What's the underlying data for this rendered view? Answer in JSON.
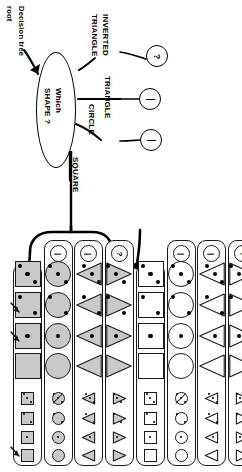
{
  "figure": {
    "type": "decision-tree-diagram",
    "orientation": "rotated-90-clockwise",
    "root_annotation": {
      "line1": "Decision tree",
      "line2": "root"
    },
    "root_node": {
      "line1": "Which",
      "line2": "SHAPE ?"
    },
    "branches": [
      {
        "id": "square",
        "label": "SQUARE"
      },
      {
        "id": "circle",
        "label": "CIRCLE"
      },
      {
        "id": "triangle",
        "label": "TRIANGLE"
      },
      {
        "id": "inverted-triangle",
        "line1": "INVERTED",
        "line2": "TRIANGLE"
      }
    ],
    "leaf_nodes": [
      {
        "id": "leaf-circle",
        "glyph": "|"
      },
      {
        "id": "leaf-triangle",
        "glyph": "|"
      },
      {
        "id": "leaf-inverted-triangle",
        "glyph": "?"
      }
    ],
    "colors": {
      "stroke": "#1a1a1a",
      "fill_gray": "#c9c9c9",
      "fill_white": "#ffffff",
      "background": "#ffffff"
    }
  },
  "grid": {
    "column_header_glyphs": [
      "",
      "|",
      "|",
      "?",
      "",
      "|",
      "|",
      "?"
    ],
    "columns": [
      {
        "id": "col-1",
        "shape": "square",
        "fill": "gray",
        "header": "",
        "linked": true,
        "cells": [
          {
            "size": "large",
            "dots": 3
          },
          {
            "size": "large",
            "dots": 2
          },
          {
            "size": "large",
            "dots": 1
          },
          {
            "size": "large",
            "dots": 0
          },
          {
            "size": "small",
            "dots": 3
          },
          {
            "size": "small",
            "dots": 2
          },
          {
            "size": "small",
            "dots": 1
          },
          {
            "size": "small",
            "dots": 0
          }
        ]
      },
      {
        "id": "col-2",
        "shape": "circle",
        "fill": "gray",
        "header": "|",
        "linked": false,
        "cells": [
          {
            "size": "large",
            "dots": 3
          },
          {
            "size": "large",
            "dots": 2
          },
          {
            "size": "large",
            "dots": 1
          },
          {
            "size": "large",
            "dots": 0
          },
          {
            "size": "small",
            "dots": 3,
            "slash": true
          },
          {
            "size": "small",
            "dots": 2
          },
          {
            "size": "small",
            "dots": 1
          },
          {
            "size": "small",
            "dots": 0
          }
        ]
      },
      {
        "id": "col-3",
        "shape": "triangle-left",
        "fill": "gray",
        "header": "|",
        "linked": false,
        "cells": [
          {
            "size": "large",
            "dots": 3
          },
          {
            "size": "large",
            "dots": 2
          },
          {
            "size": "large",
            "dots": 1
          },
          {
            "size": "large",
            "dots": 0
          },
          {
            "size": "small",
            "dots": 3
          },
          {
            "size": "small",
            "dots": 2
          },
          {
            "size": "small",
            "dots": 1
          },
          {
            "size": "small",
            "dots": 0
          }
        ]
      },
      {
        "id": "col-4",
        "shape": "triangle-right",
        "fill": "gray",
        "header": "?",
        "linked": false,
        "cells": [
          {
            "size": "large",
            "dots": 3
          },
          {
            "size": "large",
            "dots": 2
          },
          {
            "size": "large",
            "dots": 1
          },
          {
            "size": "large",
            "dots": 0
          },
          {
            "size": "small",
            "dots": 3
          },
          {
            "size": "small",
            "dots": 2
          },
          {
            "size": "small",
            "dots": 1
          },
          {
            "size": "small",
            "dots": 0
          }
        ]
      },
      {
        "id": "col-5",
        "shape": "square",
        "fill": "white",
        "header": "",
        "linked": true,
        "cells": [
          {
            "size": "large",
            "dots": 3
          },
          {
            "size": "large",
            "dots": 2
          },
          {
            "size": "large",
            "dots": 1
          },
          {
            "size": "large",
            "dots": 0
          },
          {
            "size": "small",
            "dots": 3
          },
          {
            "size": "small",
            "dots": 2
          },
          {
            "size": "small",
            "dots": 1
          },
          {
            "size": "small",
            "dots": 0
          }
        ]
      },
      {
        "id": "col-6",
        "shape": "circle",
        "fill": "white",
        "header": "|",
        "linked": false,
        "cells": [
          {
            "size": "large",
            "dots": 3
          },
          {
            "size": "large",
            "dots": 2
          },
          {
            "size": "large",
            "dots": 1
          },
          {
            "size": "large",
            "dots": 0
          },
          {
            "size": "small",
            "dots": 3,
            "slash": true
          },
          {
            "size": "small",
            "dots": 2
          },
          {
            "size": "small",
            "dots": 1
          },
          {
            "size": "small",
            "dots": 0
          }
        ]
      },
      {
        "id": "col-7",
        "shape": "triangle-left",
        "fill": "white",
        "header": "|",
        "linked": false,
        "cells": [
          {
            "size": "large",
            "dots": 3
          },
          {
            "size": "large",
            "dots": 2
          },
          {
            "size": "large",
            "dots": 1
          },
          {
            "size": "large",
            "dots": 0
          },
          {
            "size": "small",
            "dots": 3
          },
          {
            "size": "small",
            "dots": 2
          },
          {
            "size": "small",
            "dots": 1
          },
          {
            "size": "small",
            "dots": 0
          }
        ]
      },
      {
        "id": "col-8",
        "shape": "triangle-right",
        "fill": "white",
        "header": "?",
        "linked": false,
        "cells": [
          {
            "size": "large",
            "dots": 3
          },
          {
            "size": "large",
            "dots": 2
          },
          {
            "size": "large",
            "dots": 1
          },
          {
            "size": "large",
            "dots": 0
          },
          {
            "size": "small",
            "dots": 3
          },
          {
            "size": "small",
            "dots": 2
          },
          {
            "size": "small",
            "dots": 1
          },
          {
            "size": "small",
            "dots": 0
          }
        ]
      }
    ]
  }
}
